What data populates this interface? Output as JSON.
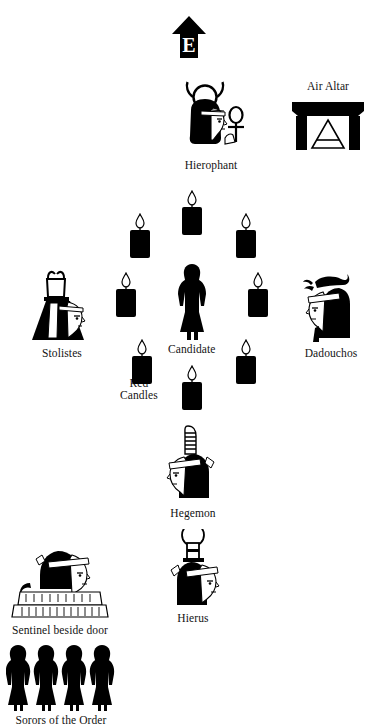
{
  "diagram": {
    "background_color": "#ffffff",
    "ink_color": "#000000",
    "orientation_marker": {
      "letter": "E",
      "meaning": "East",
      "icon": "up-arrow-marker"
    }
  },
  "officers": [
    {
      "id": "hierophant",
      "label": "Hierophant",
      "icon": "hierophant-head-icon",
      "facing": "right",
      "headdress": "horned-sun-disk",
      "implement": "ankh",
      "x": 173,
      "y": 80
    },
    {
      "id": "stolistes",
      "label": "Stolistes",
      "icon": "stolistes-head-icon",
      "facing": "right",
      "headdress": "horned-vessel",
      "x": 26,
      "y": 266
    },
    {
      "id": "dadouchos",
      "label": "Dadouchos",
      "icon": "dadouchos-head-icon",
      "facing": "left",
      "headdress": "scorpion",
      "x": 295,
      "y": 266
    },
    {
      "id": "hegemon",
      "label": "Hegemon",
      "icon": "hegemon-head-icon",
      "facing": "left",
      "headdress": "tall-plume",
      "x": 157,
      "y": 424
    },
    {
      "id": "hierus",
      "label": "Hierus",
      "icon": "hierus-head-icon",
      "facing": "right",
      "headdress": "disk-on-pillar",
      "x": 157,
      "y": 529
    },
    {
      "id": "sentinel",
      "label": "Sentinel beside door",
      "icon": "sentinel-seated-icon",
      "facing": "right",
      "x": 8,
      "y": 545
    }
  ],
  "candidate": {
    "id": "candidate",
    "label": "Candidate",
    "icon": "candidate-figure-icon",
    "x": 168,
    "y": 262
  },
  "sorors": {
    "id": "sorors",
    "label": "Sorors of the Order",
    "icon": "robed-figures-row-icon",
    "count": 4,
    "x": 6,
    "y": 643
  },
  "altar": {
    "id": "air-altar",
    "label": "Air Altar",
    "icon": "air-altar-icon",
    "symbol": "air-triangle",
    "x": 288,
    "y": 80
  },
  "candles": {
    "group_label": "Red\nCandles",
    "icon": "red-candle-icon",
    "count": 8,
    "positions": [
      {
        "id": "candle-top-center",
        "x": 178,
        "y": 190
      },
      {
        "id": "candle-upper-left",
        "x": 126,
        "y": 213
      },
      {
        "id": "candle-upper-right",
        "x": 232,
        "y": 213
      },
      {
        "id": "candle-mid-left",
        "x": 112,
        "y": 272
      },
      {
        "id": "candle-mid-right",
        "x": 244,
        "y": 272
      },
      {
        "id": "candle-lower-left",
        "x": 128,
        "y": 339
      },
      {
        "id": "candle-lower-right",
        "x": 232,
        "y": 339
      },
      {
        "id": "candle-bottom-center",
        "x": 178,
        "y": 365
      }
    ],
    "label_x": 120,
    "label_y": 374
  }
}
